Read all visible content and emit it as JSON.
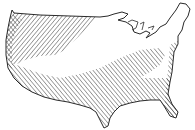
{
  "map": {
    "subject": "continental-united-states",
    "style": "line-hatching",
    "colors": {
      "background": "#ffffff",
      "ink": "#2a2a2a",
      "hatch": "#3a3a3a"
    },
    "regions": [
      {
        "name": "northwest-hatched",
        "pattern": "diagonal-down-right"
      },
      {
        "name": "west-coast-hatched",
        "pattern": "diagonal-chevron"
      },
      {
        "name": "central-south-hatched",
        "pattern": "diagonal-up-right"
      },
      {
        "name": "east-coast-hatched",
        "pattern": "diagonal-up-right"
      },
      {
        "name": "central-plains-blank",
        "pattern": "none"
      },
      {
        "name": "northeast-blank",
        "pattern": "none"
      }
    ]
  }
}
